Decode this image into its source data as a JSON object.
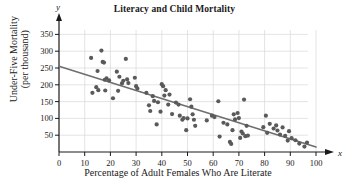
{
  "chart_data": {
    "type": "scatter",
    "title": "Literacy and Child Mortality",
    "xlabel": "Percentage of Adult Females Who Are Literate",
    "ylabel_line1": "Under-Five Mortality",
    "ylabel_line2": "(per thousand)",
    "x_axis_variable": "x",
    "y_axis_variable": "y",
    "xlim": [
      0,
      100
    ],
    "ylim": [
      0,
      375
    ],
    "xticks": [
      0,
      10,
      20,
      30,
      40,
      50,
      60,
      70,
      80,
      90,
      100
    ],
    "yticks": [
      50,
      100,
      150,
      200,
      250,
      300,
      350
    ],
    "grid": true,
    "grid_color": "#d8d8d8",
    "point_color": "#5a5a5a",
    "line_color": "#6e6e6e",
    "axis_color": "#1a1a1a",
    "trend_line": {
      "x0": 0,
      "y0": 255,
      "x1": 100,
      "y1": 15
    },
    "points": [
      [
        12.5,
        280
      ],
      [
        13.0,
        176
      ],
      [
        14.5,
        193
      ],
      [
        15.0,
        241
      ],
      [
        15.3,
        184
      ],
      [
        16.5,
        302
      ],
      [
        17.0,
        268
      ],
      [
        17.5,
        266
      ],
      [
        17.8,
        215
      ],
      [
        18.0,
        183
      ],
      [
        18.5,
        219
      ],
      [
        19.5,
        213
      ],
      [
        21.0,
        160
      ],
      [
        22.5,
        239
      ],
      [
        23.0,
        182
      ],
      [
        23.5,
        224
      ],
      [
        24.5,
        204
      ],
      [
        25.0,
        212
      ],
      [
        26.0,
        277
      ],
      [
        26.5,
        216
      ],
      [
        27.0,
        205
      ],
      [
        29.5,
        221
      ],
      [
        30.0,
        196
      ],
      [
        30.5,
        189
      ],
      [
        34.0,
        176
      ],
      [
        35.0,
        139
      ],
      [
        35.5,
        122
      ],
      [
        36.5,
        166
      ],
      [
        37.0,
        152
      ],
      [
        38.0,
        82
      ],
      [
        38.5,
        148
      ],
      [
        39.5,
        120
      ],
      [
        40.0,
        202
      ],
      [
        40.5,
        196
      ],
      [
        41.0,
        168
      ],
      [
        41.5,
        184
      ],
      [
        42.5,
        141
      ],
      [
        43.0,
        171
      ],
      [
        44.0,
        113
      ],
      [
        45.5,
        147
      ],
      [
        46.5,
        141
      ],
      [
        47.0,
        108
      ],
      [
        48.0,
        96
      ],
      [
        48.5,
        101
      ],
      [
        49.5,
        65
      ],
      [
        50.0,
        100
      ],
      [
        51.0,
        157
      ],
      [
        51.5,
        135
      ],
      [
        52.0,
        112
      ],
      [
        52.5,
        96
      ],
      [
        53.0,
        78
      ],
      [
        57.5,
        94
      ],
      [
        59.5,
        108
      ],
      [
        60.5,
        104
      ],
      [
        62.0,
        151
      ],
      [
        62.5,
        46
      ],
      [
        64.0,
        87
      ],
      [
        65.5,
        82
      ],
      [
        66.5,
        30
      ],
      [
        67.0,
        24
      ],
      [
        67.5,
        65
      ],
      [
        68.0,
        112
      ],
      [
        68.5,
        97
      ],
      [
        69.5,
        116
      ],
      [
        70.0,
        101
      ],
      [
        70.5,
        42
      ],
      [
        71.0,
        61
      ],
      [
        71.5,
        55
      ],
      [
        72.0,
        156
      ],
      [
        72.5,
        47
      ],
      [
        73.0,
        78
      ],
      [
        73.5,
        49
      ],
      [
        79.5,
        74
      ],
      [
        80.5,
        108
      ],
      [
        81.0,
        57
      ],
      [
        82.0,
        84
      ],
      [
        83.5,
        70
      ],
      [
        84.5,
        79
      ],
      [
        85.0,
        64
      ],
      [
        86.0,
        52
      ],
      [
        87.0,
        73
      ],
      [
        88.0,
        48
      ],
      [
        89.0,
        34
      ],
      [
        89.5,
        62
      ],
      [
        90.5,
        41
      ],
      [
        92.0,
        35
      ],
      [
        93.5,
        25
      ],
      [
        95.5,
        16
      ],
      [
        96.5,
        28
      ]
    ]
  }
}
